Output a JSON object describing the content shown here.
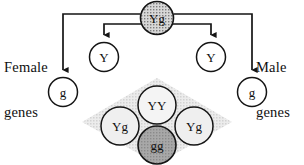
{
  "diagram": {
    "labels": {
      "female_genes_line1": "Female",
      "female_genes_line2": "genes",
      "male_genes_line1": "Male",
      "male_genes_line2": "genes"
    },
    "parent": {
      "id": "parent-genotype",
      "label": "Yg",
      "fill": "#d0d0d0",
      "stroke": "#151515",
      "cx": 157,
      "cy": 18,
      "r": 16.5,
      "font_size": 13
    },
    "gametes": [
      {
        "id": "gamete-female-g",
        "label": "g",
        "side": "female",
        "fill": "#ffffff",
        "stroke": "#151515",
        "cx": 63,
        "cy": 92,
        "r": 14.5,
        "font_size": 13
      },
      {
        "id": "gamete-female-y",
        "label": "Y",
        "side": "female",
        "fill": "#ffffff",
        "stroke": "#151515",
        "cx": 104,
        "cy": 57,
        "r": 14.5,
        "font_size": 13
      },
      {
        "id": "gamete-male-y",
        "label": "Y",
        "side": "male",
        "fill": "#ffffff",
        "stroke": "#151515",
        "cx": 211,
        "cy": 57,
        "r": 14.5,
        "font_size": 13
      },
      {
        "id": "gamete-male-g",
        "label": "g",
        "side": "male",
        "fill": "#ffffff",
        "stroke": "#151515",
        "cx": 252,
        "cy": 92,
        "r": 14.5,
        "font_size": 13
      }
    ],
    "offspring_region": {
      "id": "punnett-diamond",
      "fill": "#dedede",
      "apex_top": {
        "x": 157,
        "y": 78
      },
      "apex_right": {
        "x": 232,
        "y": 122
      },
      "apex_bottom": {
        "x": 157,
        "y": 164
      },
      "apex_left": {
        "x": 82,
        "y": 122
      }
    },
    "offspring": [
      {
        "id": "offspring-yy",
        "label": "YY",
        "fill": "#f2f2f2",
        "stroke": "#151515",
        "cx": 157,
        "cy": 105,
        "r": 19,
        "font_size": 13
      },
      {
        "id": "offspring-yg-left",
        "label": "Yg",
        "fill": "#ececec",
        "stroke": "#151515",
        "cx": 120,
        "cy": 126,
        "r": 19,
        "font_size": 13
      },
      {
        "id": "offspring-yg-right",
        "label": "Yg",
        "fill": "#ececec",
        "stroke": "#151515",
        "cx": 194,
        "cy": 126,
        "r": 19,
        "font_size": 13
      },
      {
        "id": "offspring-gg",
        "label": "gg",
        "fill": "#9e9e9e",
        "stroke": "#151515",
        "cx": 157,
        "cy": 145,
        "r": 19,
        "font_size": 13
      }
    ],
    "connectors": [
      {
        "id": "connector-parent-to-female-g",
        "target": "gamete-female-g"
      },
      {
        "id": "connector-parent-to-female-y",
        "target": "gamete-female-y"
      },
      {
        "id": "connector-parent-to-male-y",
        "target": "gamete-male-y"
      },
      {
        "id": "connector-parent-to-male-g",
        "target": "gamete-male-g"
      }
    ],
    "colors": {
      "line": "#151515",
      "text": "#111111",
      "background": "#ffffff"
    }
  }
}
